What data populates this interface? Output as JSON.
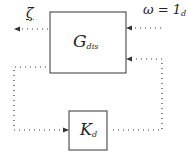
{
  "diagram": {
    "blocks": [
      {
        "id": "plant",
        "label": "G",
        "subscript": "dis"
      },
      {
        "id": "controller",
        "label": "K",
        "subscript": "d"
      }
    ],
    "signals": {
      "output": {
        "label": "ζ"
      },
      "input": {
        "label": "ω = 1",
        "subscript": "d"
      }
    },
    "colors": {
      "line": "#333333",
      "block_border": "#555555"
    }
  }
}
